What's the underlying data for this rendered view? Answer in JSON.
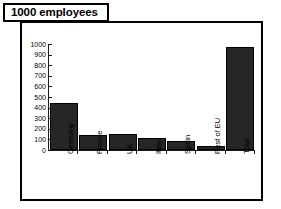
{
  "title": {
    "text": "1000 employees"
  },
  "chart_data": {
    "type": "bar",
    "title": "1000 employees",
    "xlabel": "",
    "ylabel": "",
    "ylim": [
      0,
      1000
    ],
    "ytick_labels": [
      "1000",
      "900",
      "800",
      "700",
      "600",
      "500",
      "400",
      "300",
      "200",
      "100",
      "0"
    ],
    "ytick_values": [
      1000,
      900,
      800,
      700,
      600,
      500,
      400,
      300,
      200,
      100,
      0
    ],
    "categories": [
      "Germany",
      "France",
      "UK",
      "Italy",
      "Spain",
      "Rest of EU",
      "Total"
    ],
    "values": [
      440,
      140,
      150,
      110,
      85,
      40,
      970
    ],
    "grid": false,
    "legend": "none",
    "bar_color": "#262626"
  }
}
